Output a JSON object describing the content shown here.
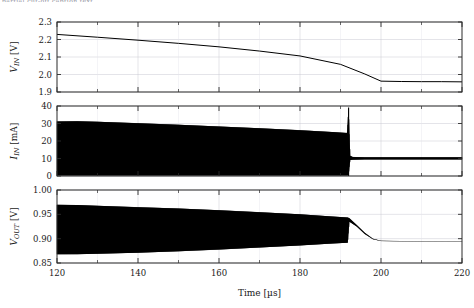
{
  "figure": {
    "cut_caption": "partial cut-off caption text",
    "background": "#ffffff",
    "trace_color": "#000000",
    "grid_color": "#c9c9d2",
    "axis_color": "#2b2b2b"
  },
  "xaxis": {
    "label": "Time [µs]",
    "unit": "µs",
    "min": 120,
    "max": 220,
    "major_ticks": [
      120,
      140,
      160,
      180,
      200,
      220
    ],
    "minor_ticks": [
      130,
      150,
      170,
      190,
      210
    ],
    "tick_labels": [
      "120",
      "140",
      "160",
      "180",
      "200",
      "220"
    ]
  },
  "chart_data": [
    {
      "type": "line",
      "title": "",
      "xlabel": "",
      "ylabel": "V_IN [V]",
      "ylabel_display": "V",
      "ylabel_sub": "IN",
      "ylabel_unit": "[V]",
      "xlim": [
        120,
        220
      ],
      "ylim": [
        1.9,
        2.3
      ],
      "yticks": [
        1.9,
        2.0,
        2.1,
        2.2,
        2.3
      ],
      "ytick_labels": [
        "1.9",
        "2.0",
        "2.1",
        "2.2",
        "2.3"
      ],
      "grid": true,
      "legend": "none",
      "series": [
        {
          "name": "V_IN",
          "x": [
            120,
            130,
            140,
            150,
            160,
            170,
            180,
            190,
            196,
            200,
            205,
            210,
            215,
            220
          ],
          "values": [
            2.229,
            2.213,
            2.196,
            2.178,
            2.158,
            2.134,
            2.106,
            2.058,
            2.003,
            1.962,
            1.96,
            1.959,
            1.959,
            1.958
          ]
        }
      ],
      "annotations": [
        "linear discharge 120-196 us then flat at ~1.96 V"
      ]
    },
    {
      "type": "area",
      "title": "",
      "xlabel": "",
      "ylabel": "I_IN [mA]",
      "ylabel_display": "I",
      "ylabel_sub": "IN",
      "ylabel_unit": "[mA]",
      "xlim": [
        120,
        220
      ],
      "ylim": [
        0,
        40
      ],
      "yticks": [
        0,
        10,
        20,
        30,
        40
      ],
      "ytick_labels": [
        "0",
        "10",
        "20",
        "30",
        "40"
      ],
      "grid": true,
      "legend": "none",
      "description": "dense switching ripple filling band between lower and upper envelope",
      "envelope": {
        "x": [
          120,
          125,
          130,
          140,
          150,
          160,
          170,
          180,
          188,
          191.6,
          192.0,
          192.4,
          193,
          196,
          200,
          210,
          220
        ],
        "upper": [
          31.2,
          31.3,
          31.0,
          30.2,
          29.3,
          28.3,
          27.3,
          26.2,
          25.1,
          24.6,
          39.2,
          11.6,
          10.9,
          10.7,
          10.7,
          10.7,
          10.7
        ],
        "lower": [
          0.35,
          0.35,
          0.35,
          0.35,
          0.35,
          0.35,
          0.35,
          0.35,
          0.35,
          0.35,
          0.4,
          9.1,
          9.3,
          9.5,
          9.5,
          9.5,
          9.5
        ]
      },
      "spike": {
        "x": 192.0,
        "peak": 39.2,
        "label": "current spike at mode transition"
      }
    },
    {
      "type": "area",
      "title": "",
      "xlabel": "",
      "ylabel": "V_OUT [V]",
      "ylabel_display": "V",
      "ylabel_sub": "OUT",
      "ylabel_unit": "[V]",
      "xlim": [
        120,
        220
      ],
      "ylim": [
        0.85,
        1.0
      ],
      "yticks": [
        0.85,
        0.9,
        0.95,
        1.0
      ],
      "ytick_labels": [
        "0.85",
        "0.90",
        "0.95",
        "1.00"
      ],
      "grid": true,
      "legend": "none",
      "description": "output ripple band narrowing, then settles to DC level after 192 us",
      "envelope": {
        "x": [
          120,
          125,
          130,
          140,
          150,
          160,
          170,
          180,
          188,
          191.8,
          192.2,
          194,
          196,
          198,
          200,
          205,
          210,
          215,
          220
        ],
        "upper": [
          0.9695,
          0.969,
          0.9675,
          0.9648,
          0.962,
          0.9585,
          0.9545,
          0.95,
          0.9455,
          0.9435,
          0.942,
          0.928,
          0.912,
          0.9,
          0.8955,
          0.895,
          0.8948,
          0.8947,
          0.8946
        ],
        "lower": [
          0.868,
          0.8682,
          0.869,
          0.8712,
          0.874,
          0.8775,
          0.8818,
          0.8862,
          0.89,
          0.8918,
          0.935,
          0.925,
          0.9095,
          0.899,
          0.895,
          0.8946,
          0.8944,
          0.8943,
          0.8942
        ]
      }
    }
  ]
}
